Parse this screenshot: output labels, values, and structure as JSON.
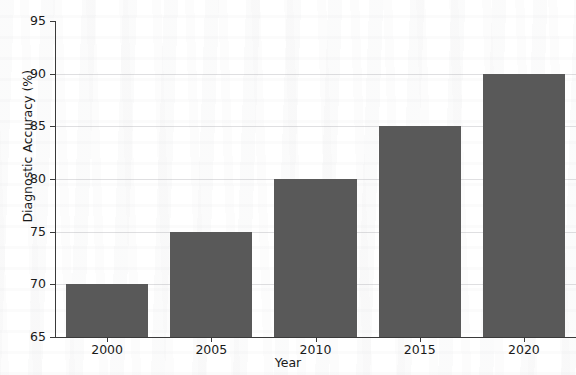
{
  "chart_data": {
    "type": "bar",
    "title": "",
    "categories": [
      "2000",
      "2005",
      "2010",
      "2015",
      "2020"
    ],
    "values": [
      70,
      75,
      80,
      85,
      90
    ],
    "series": [
      {
        "name": "Diagnostic Accuracy",
        "values": [
          70,
          75,
          80,
          85,
          90
        ]
      }
    ],
    "xlabel": "Year",
    "ylabel": "Diagnostic Accuracy (%)",
    "ylim": [
      65,
      95
    ],
    "yticks": [
      65,
      70,
      75,
      80,
      85,
      90,
      95
    ],
    "ytick_labels": [
      "65",
      "70",
      "75",
      "80",
      "85",
      "90",
      "95"
    ],
    "xtick_labels": [
      "2000",
      "2005",
      "2010",
      "2015",
      "2020"
    ],
    "grid": true,
    "grid_axis": "y",
    "legend": false,
    "legend_position": "none",
    "bar_color": "#595959",
    "background_color": "#ffffff",
    "axis_color": "#3a3a3a",
    "text_color": "#1a1a1a"
  }
}
